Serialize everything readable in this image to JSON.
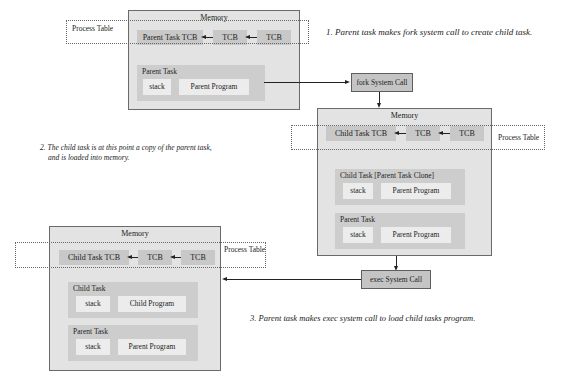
{
  "steps": [
    {
      "label": "1. Parent task makes fork system call to create child task."
    },
    {
      "label_line1": "2. The child task is at this point a copy of the parent task,",
      "label_line2": "and is loaded into memory."
    },
    {
      "label": "3. Parent task makes exec system call to load child tasks program."
    }
  ],
  "syscalls": {
    "fork": "fork System Call",
    "exec": "exec System Call"
  },
  "memory1": {
    "title": "Memory",
    "process_table": "Process Table",
    "tcbs": [
      "Parent Task TCB",
      "TCB",
      "TCB"
    ],
    "tasks": [
      {
        "title": "Parent Task",
        "stack": "stack",
        "program": "Parent Program"
      }
    ]
  },
  "memory2": {
    "title": "Memory",
    "process_table": "Process Table",
    "tcbs": [
      "Child Task TCB",
      "TCB",
      "TCB"
    ],
    "tasks": [
      {
        "title": "Child Task [Parent Task Clone]",
        "stack": "stack",
        "program": "Parent Program"
      },
      {
        "title": "Parent Task",
        "stack": "stack",
        "program": "Parent Program"
      }
    ]
  },
  "memory3": {
    "title": "Memory",
    "process_table": "Process Table",
    "tcbs": [
      "Child Task TCB",
      "TCB",
      "TCB"
    ],
    "tasks": [
      {
        "title": "Child Task",
        "stack": "stack",
        "program": "Child Program"
      },
      {
        "title": "Parent Task",
        "stack": "stack",
        "program": "Parent Program"
      }
    ]
  }
}
